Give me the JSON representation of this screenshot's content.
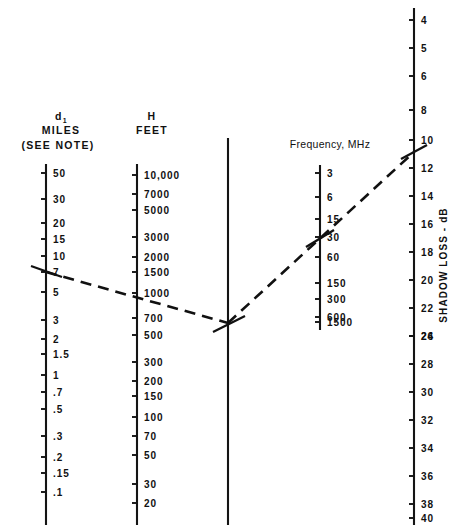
{
  "figure": {
    "type": "nomogram"
  },
  "axes": {
    "d1": {
      "title_main": "d",
      "title_sub": "1",
      "title_units": "MILES",
      "title_note": "(SEE NOTE)",
      "x": 46,
      "y_top": 164,
      "y_bottom": 525,
      "ticks": [
        {
          "label": "50",
          "y": 173
        },
        {
          "label": "30",
          "y": 199
        },
        {
          "label": "20",
          "y": 223
        },
        {
          "label": "15",
          "y": 239
        },
        {
          "label": "10",
          "y": 256
        },
        {
          "label": "7",
          "y": 272
        },
        {
          "label": "5",
          "y": 292
        },
        {
          "label": "3",
          "y": 320
        },
        {
          "label": "2",
          "y": 339
        },
        {
          "label": "1.5",
          "y": 354
        },
        {
          "label": "1",
          "y": 375
        },
        {
          "label": ".7",
          "y": 392
        },
        {
          "label": ".5",
          "y": 409
        },
        {
          "label": ".3",
          "y": 436
        },
        {
          "label": ".2",
          "y": 457
        },
        {
          "label": ".15",
          "y": 473
        },
        {
          "label": ".1",
          "y": 492
        }
      ]
    },
    "h": {
      "title_main": "H",
      "title_units": "FEET",
      "x": 137,
      "y_top": 164,
      "y_bottom": 525,
      "ticks": [
        {
          "label": "10,000",
          "y": 175
        },
        {
          "label": "7000",
          "y": 194
        },
        {
          "label": "5000",
          "y": 210
        },
        {
          "label": "3000",
          "y": 237
        },
        {
          "label": "2000",
          "y": 257
        },
        {
          "label": "1500",
          "y": 272
        },
        {
          "label": "1000",
          "y": 293
        },
        {
          "label": "700",
          "y": 318
        },
        {
          "label": "500",
          "y": 335
        },
        {
          "label": "300",
          "y": 362
        },
        {
          "label": "200",
          "y": 381
        },
        {
          "label": "150",
          "y": 396
        },
        {
          "label": "100",
          "y": 417
        },
        {
          "label": "70",
          "y": 436
        },
        {
          "label": "50",
          "y": 455
        },
        {
          "label": "30",
          "y": 484
        },
        {
          "label": "20",
          "y": 503
        }
      ]
    },
    "pivot": {
      "x": 228,
      "y_top": 138,
      "y_bottom": 525,
      "ticks": []
    },
    "frequency": {
      "title": "Frequency, MHz",
      "x": 320,
      "y_top": 165,
      "y_bottom": 330,
      "ticks": [
        {
          "label": "3",
          "y": 173
        },
        {
          "label": "6",
          "y": 197
        },
        {
          "label": "15",
          "y": 219
        },
        {
          "label": "30",
          "y": 237
        },
        {
          "label": "60",
          "y": 257
        },
        {
          "label": "150",
          "y": 283
        },
        {
          "label": "300",
          "y": 299
        },
        {
          "label": "600",
          "y": 317
        },
        {
          "label": "1500",
          "y": 322
        }
      ]
    },
    "shadow_loss": {
      "title": "SHADOW LOSS - dB",
      "x": 414,
      "y_top": 8,
      "y_bottom": 525,
      "ticks": [
        {
          "label": "4",
          "y": 20
        },
        {
          "label": "5",
          "y": 48
        },
        {
          "label": "6",
          "y": 76
        },
        {
          "label": "8",
          "y": 110
        },
        {
          "label": "10",
          "y": 140
        },
        {
          "label": "12",
          "y": 168
        },
        {
          "label": "14",
          "y": 196
        },
        {
          "label": "16",
          "y": 224
        },
        {
          "label": "18",
          "y": 252
        },
        {
          "label": "20",
          "y": 280
        },
        {
          "label": "22",
          "y": 308
        },
        {
          "label": "24",
          "y": 336
        },
        {
          "label": "26",
          "y": 336
        },
        {
          "label": "28",
          "y": 364
        },
        {
          "label": "30",
          "y": 392
        },
        {
          "label": "32",
          "y": 420
        },
        {
          "label": "34",
          "y": 448
        },
        {
          "label": "36",
          "y": 476
        },
        {
          "label": "38",
          "y": 504
        },
        {
          "label": "40",
          "y": 518
        }
      ]
    }
  },
  "construction_line": {
    "color": "#111111",
    "segment_1": {
      "x1": 46,
      "y1": 272,
      "x2": 228,
      "y2": 323
    },
    "segment_2": {
      "x1": 228,
      "y1": 323,
      "x2": 414,
      "y2": 152
    },
    "crossings": [
      {
        "axis": "d1",
        "value": "7",
        "x": 46,
        "y": 272
      },
      {
        "axis": "h",
        "value": "1000",
        "x": 137,
        "y": 295
      },
      {
        "axis": "pivot",
        "value": "",
        "x": 228,
        "y": 323
      },
      {
        "axis": "frequency",
        "value": "30",
        "x": 320,
        "y": 238
      },
      {
        "axis": "shadow_loss",
        "value": "11",
        "x": 414,
        "y": 152
      }
    ]
  }
}
